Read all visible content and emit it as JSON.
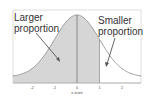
{
  "chart_data": {
    "type": "area",
    "title": "",
    "xlabel": "z-score",
    "ylabel": "",
    "x_ticks": [
      "-2",
      "-1",
      "0",
      "1",
      "2"
    ],
    "xlim": [
      -3,
      3
    ],
    "distribution": "normal",
    "mean": 0,
    "sd": 1,
    "shaded_region": {
      "from": -3,
      "to": 1,
      "label": "Larger proportion"
    },
    "unshaded_region": {
      "from": 1,
      "to": 3,
      "label": "Smaller proportion"
    },
    "vertical_lines": [
      0,
      1
    ],
    "grid": false
  },
  "annotations": {
    "left": "Larger\nproportion",
    "right": "Smaller\nproportion"
  },
  "colors": {
    "shade": "#d4d4d4",
    "curve": "#8a8a8a",
    "frame": "#b0b0b0",
    "arrow": "#555555"
  }
}
